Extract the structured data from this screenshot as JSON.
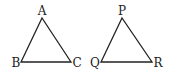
{
  "diagram": {
    "triangles": [
      {
        "name": "ABC",
        "vertices": [
          {
            "label": "A",
            "x": 42,
            "y": 18,
            "lx": 42,
            "ly": 15,
            "anchor": "middle"
          },
          {
            "label": "B",
            "x": 21,
            "y": 62,
            "lx": 16,
            "ly": 67,
            "anchor": "middle"
          },
          {
            "label": "C",
            "x": 71,
            "y": 62,
            "lx": 77,
            "ly": 67,
            "anchor": "middle"
          }
        ]
      },
      {
        "name": "PQR",
        "vertices": [
          {
            "label": "P",
            "x": 122,
            "y": 18,
            "lx": 122,
            "ly": 15,
            "anchor": "middle"
          },
          {
            "label": "Q",
            "x": 101,
            "y": 62,
            "lx": 95,
            "ly": 67,
            "anchor": "middle"
          },
          {
            "label": "R",
            "x": 152,
            "y": 62,
            "lx": 158,
            "ly": 67,
            "anchor": "middle"
          }
        ]
      }
    ],
    "stroke_color": "#222222"
  }
}
